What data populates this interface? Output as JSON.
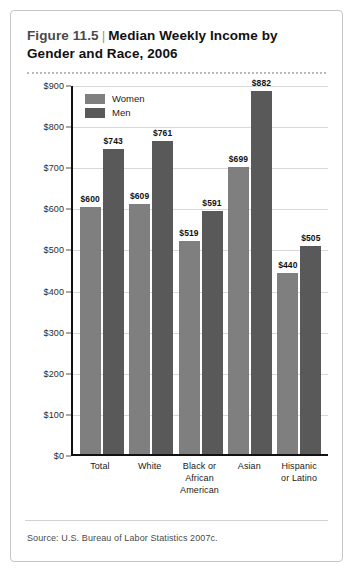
{
  "figure": {
    "number_label": "Figure 11.5",
    "separator": "|",
    "title": "Median Weekly Income by Gender and Race, 2006",
    "source": "Source: U.S. Bureau of Labor Statistics 2007c."
  },
  "colors": {
    "women_bar": "#7f7f7f",
    "men_bar": "#595959",
    "axis": "#111111",
    "gridline": "#d9d9d9",
    "card_border": "#c6c6c6"
  },
  "legend": {
    "position": "top-left-inside",
    "items": [
      {
        "label": "Women",
        "color": "#7f7f7f"
      },
      {
        "label": "Men",
        "color": "#595959"
      }
    ]
  },
  "axes": {
    "ylabel": "Earnings",
    "ytick_labels": [
      "$900",
      "$800",
      "$700",
      "$600",
      "$500",
      "$400",
      "$300",
      "$200",
      "$100",
      "$0"
    ],
    "ytick_values": [
      900,
      800,
      700,
      600,
      500,
      400,
      300,
      200,
      100,
      0
    ],
    "ylim": [
      0,
      900
    ],
    "xlabel": ""
  },
  "chart_data": {
    "type": "bar",
    "title": "Median Weekly Income by Gender and Race, 2006",
    "xlabel": "",
    "ylabel": "Earnings",
    "ylim": [
      0,
      900
    ],
    "grid": true,
    "legend_position": "top-left-inside",
    "categories": [
      "Total",
      "White",
      "Black or African American",
      "Asian",
      "Hispanic or Latino"
    ],
    "category_label_lines": [
      [
        "Total"
      ],
      [
        "White"
      ],
      [
        "Black or",
        "African",
        "American"
      ],
      [
        "Asian"
      ],
      [
        "Hispanic",
        "or Latino"
      ]
    ],
    "series": [
      {
        "name": "Women",
        "color": "#7f7f7f",
        "values": [
          600,
          609,
          519,
          699,
          440
        ],
        "value_labels": [
          "$600",
          "$609",
          "$519",
          "$699",
          "$440"
        ]
      },
      {
        "name": "Men",
        "color": "#595959",
        "values": [
          743,
          761,
          591,
          882,
          505
        ],
        "value_labels": [
          "$743",
          "$761",
          "$591",
          "$882",
          "$505"
        ]
      }
    ]
  }
}
